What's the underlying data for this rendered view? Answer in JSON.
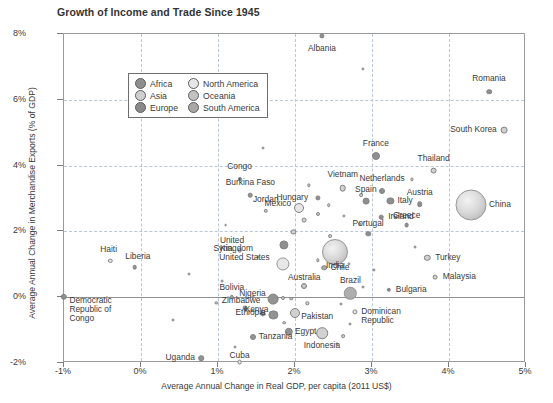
{
  "chart_data": {
    "type": "scatter",
    "title": "Growth of Income and Trade Since 1945",
    "xlabel": "Average Annual Change in Real GDP, per capita (2011 US$)",
    "ylabel": "Average Annual Change in Merchandise Exports (% of GDP)",
    "xlim": [
      -1,
      5
    ],
    "ylim": [
      -2,
      8
    ],
    "xticks": [
      "-1%",
      "0%",
      "1%",
      "2%",
      "3%",
      "4%",
      "5%"
    ],
    "xtick_values": [
      -1,
      0,
      1,
      2,
      3,
      4,
      5
    ],
    "yticks": [
      "8%",
      "6%",
      "4%",
      "2%",
      "0%",
      "-2%"
    ],
    "ytick_values": [
      8,
      6,
      4,
      2,
      0,
      -2
    ],
    "grid": true,
    "size_encodes": "population / economy size",
    "legend": {
      "position": "top-left inside plot",
      "title": "",
      "entries": [
        {
          "label": "Africa",
          "color": "#8e8e8e"
        },
        {
          "label": "North America",
          "color": "#e6e6e6"
        },
        {
          "label": "Asia",
          "color": "#cfcfcf"
        },
        {
          "label": "Oceania",
          "color": "#c2c2c2"
        },
        {
          "label": "Europe",
          "color": "#8a8a8a"
        },
        {
          "label": "South America",
          "color": "#a8a8a8"
        }
      ]
    },
    "points": [
      {
        "name": "Albania",
        "x": 2.35,
        "y": 7.95,
        "r": 2.6,
        "group": "Europe",
        "lx": 2.35,
        "ly": 7.55,
        "anchor": "c"
      },
      {
        "name": "Romania",
        "x": 4.52,
        "y": 6.25,
        "r": 2.8,
        "group": "Europe",
        "lx": 4.52,
        "ly": 6.62,
        "anchor": "c"
      },
      {
        "name": "South Korea",
        "x": 4.72,
        "y": 5.07,
        "r": 3.4,
        "group": "Asia",
        "lx": 4.62,
        "ly": 5.07,
        "anchor": "r"
      },
      {
        "name": "France",
        "x": 3.05,
        "y": 4.28,
        "r": 4.0,
        "group": "Europe",
        "lx": 3.05,
        "ly": 4.66,
        "anchor": "c"
      },
      {
        "name": "Thailand",
        "x": 3.8,
        "y": 3.85,
        "r": 3.4,
        "group": "Asia",
        "lx": 3.8,
        "ly": 4.2,
        "anchor": "c"
      },
      {
        "name": "Vietnam",
        "x": 2.62,
        "y": 3.32,
        "r": 3.3,
        "group": "Asia",
        "lx": 2.62,
        "ly": 3.72,
        "anchor": "c"
      },
      {
        "name": "Netherlands",
        "x": 3.13,
        "y": 3.22,
        "r": 3.0,
        "group": "Europe",
        "lx": 3.13,
        "ly": 3.58,
        "anchor": "c"
      },
      {
        "name": "Congo",
        "x": 1.28,
        "y": 3.6,
        "r": 2.1,
        "group": "Africa",
        "lx": 1.28,
        "ly": 3.96,
        "anchor": "c"
      },
      {
        "name": "Burkina Faso",
        "x": 1.42,
        "y": 3.1,
        "r": 2.3,
        "group": "Africa",
        "lx": 1.42,
        "ly": 3.46,
        "anchor": "c"
      },
      {
        "name": "Hungary",
        "x": 2.3,
        "y": 3.02,
        "r": 2.6,
        "group": "Europe",
        "lx": 2.17,
        "ly": 3.02,
        "anchor": "r"
      },
      {
        "name": "Spain",
        "x": 2.92,
        "y": 2.92,
        "r": 3.4,
        "group": "Europe",
        "lx": 2.92,
        "ly": 3.25,
        "anchor": "c"
      },
      {
        "name": "Italy",
        "x": 3.24,
        "y": 2.92,
        "r": 3.6,
        "group": "Europe",
        "lx": 3.33,
        "ly": 2.92,
        "anchor": "l"
      },
      {
        "name": "Austria",
        "x": 3.62,
        "y": 2.82,
        "r": 2.8,
        "group": "Europe",
        "lx": 3.62,
        "ly": 3.18,
        "anchor": "c"
      },
      {
        "name": "China",
        "x": 4.28,
        "y": 2.8,
        "r": 15.5,
        "group": "Asia",
        "lx": 4.52,
        "ly": 2.8,
        "anchor": "l"
      },
      {
        "name": "Mexico",
        "x": 2.05,
        "y": 2.7,
        "r": 5.0,
        "group": "North America",
        "lx": 1.95,
        "ly": 2.82,
        "anchor": "r"
      },
      {
        "name": "Jordan",
        "x": 1.62,
        "y": 2.62,
        "r": 2.2,
        "group": "Asia",
        "lx": 1.62,
        "ly": 2.96,
        "anchor": "c"
      },
      {
        "name": "Ireland",
        "x": 3.12,
        "y": 2.44,
        "r": 2.3,
        "group": "Europe",
        "lx": 3.21,
        "ly": 2.44,
        "anchor": "l"
      },
      {
        "name": "Greece",
        "x": 3.45,
        "y": 2.18,
        "r": 2.4,
        "group": "Europe",
        "lx": 3.45,
        "ly": 2.48,
        "anchor": "c"
      },
      {
        "name": "Portugal",
        "x": 2.95,
        "y": 1.92,
        "r": 2.7,
        "group": "Europe",
        "lx": 2.95,
        "ly": 2.24,
        "anchor": "c"
      },
      {
        "name": "United Kingdom",
        "x": 1.86,
        "y": 1.6,
        "r": 4.6,
        "group": "Europe",
        "lx": 1.7,
        "ly": 1.72,
        "anchor": "r"
      },
      {
        "name": "Syria",
        "x": 1.28,
        "y": 1.42,
        "r": 2.3,
        "group": "Asia",
        "lx": 1.19,
        "ly": 1.48,
        "anchor": "r"
      },
      {
        "name": "India",
        "x": 2.52,
        "y": 1.38,
        "r": 13.0,
        "group": "Asia",
        "lx": 2.52,
        "ly": 0.95,
        "anchor": "c"
      },
      {
        "name": "Turkey",
        "x": 3.72,
        "y": 1.2,
        "r": 3.2,
        "group": "Asia",
        "lx": 3.82,
        "ly": 1.2,
        "anchor": "l"
      },
      {
        "name": "United States",
        "x": 1.84,
        "y": 1.02,
        "r": 6.6,
        "group": "North America",
        "lx": 1.67,
        "ly": 1.18,
        "anchor": "r"
      },
      {
        "name": "Chile",
        "x": 2.38,
        "y": 0.9,
        "r": 2.8,
        "group": "South America",
        "lx": 2.46,
        "ly": 0.88,
        "anchor": "l"
      },
      {
        "name": "Malaysia",
        "x": 3.82,
        "y": 0.62,
        "r": 2.4,
        "group": "Asia",
        "lx": 3.92,
        "ly": 0.62,
        "anchor": "l"
      },
      {
        "name": "Australia",
        "x": 2.12,
        "y": 0.34,
        "r": 3.0,
        "group": "Oceania",
        "lx": 2.12,
        "ly": 0.58,
        "anchor": "c"
      },
      {
        "name": "Haiti",
        "x": -0.4,
        "y": 1.1,
        "r": 2.2,
        "group": "North America",
        "lx": -0.42,
        "ly": 1.42,
        "anchor": "c"
      },
      {
        "name": "Liberia",
        "x": -0.08,
        "y": 0.92,
        "r": 2.3,
        "group": "Africa",
        "lx": -0.04,
        "ly": 1.22,
        "anchor": "c"
      },
      {
        "name": "Brazil",
        "x": 2.72,
        "y": 0.12,
        "r": 6.2,
        "group": "South America",
        "lx": 2.72,
        "ly": 0.5,
        "anchor": "c"
      },
      {
        "name": "Bulgaria",
        "x": 3.22,
        "y": 0.22,
        "r": 2.2,
        "group": "Europe",
        "lx": 3.31,
        "ly": 0.22,
        "anchor": "l"
      },
      {
        "name": "Nigeria",
        "x": 1.72,
        "y": -0.06,
        "r": 5.4,
        "group": "Africa",
        "lx": 1.62,
        "ly": 0.1,
        "anchor": "r"
      },
      {
        "name": "Bolivia",
        "x": 1.18,
        "y": 0.02,
        "r": 2.2,
        "group": "South America",
        "lx": 1.18,
        "ly": 0.28,
        "anchor": "c"
      },
      {
        "name": "Democratic Republic of Congo",
        "x": -1.0,
        "y": 0.02,
        "r": 3.2,
        "group": "Africa",
        "lx": -0.93,
        "ly": -0.12,
        "anchor": "l"
      },
      {
        "name": "Zimbabwe",
        "x": 1.35,
        "y": -0.32,
        "r": 2.5,
        "group": "Africa",
        "lx": 1.3,
        "ly": -0.12,
        "anchor": "c"
      },
      {
        "name": "Kenya",
        "x": 1.58,
        "y": -0.52,
        "r": 2.6,
        "group": "Africa",
        "lx": 1.5,
        "ly": -0.4,
        "anchor": "c"
      },
      {
        "name": "Ethiopia",
        "x": 1.72,
        "y": -0.55,
        "r": 4.6,
        "group": "Africa",
        "lx": 1.62,
        "ly": -0.48,
        "anchor": "r"
      },
      {
        "name": "Pakistan",
        "x": 2.0,
        "y": -0.48,
        "r": 5.0,
        "group": "Asia",
        "lx": 2.08,
        "ly": -0.6,
        "anchor": "l"
      },
      {
        "name": "Dominican Republic",
        "x": 2.78,
        "y": -0.45,
        "r": 2.6,
        "group": "North America",
        "lx": 2.86,
        "ly": -0.45,
        "anchor": "l"
      },
      {
        "name": "Egypt",
        "x": 1.92,
        "y": -1.05,
        "r": 4.2,
        "group": "Africa",
        "lx": 2.0,
        "ly": -1.05,
        "anchor": "l"
      },
      {
        "name": "Indonesia",
        "x": 2.35,
        "y": -1.1,
        "r": 5.8,
        "group": "Asia",
        "lx": 2.35,
        "ly": -1.48,
        "anchor": "c"
      },
      {
        "name": "Tanzania",
        "x": 1.45,
        "y": -1.22,
        "r": 3.0,
        "group": "Africa",
        "lx": 1.53,
        "ly": -1.22,
        "anchor": "l"
      },
      {
        "name": "Uganda",
        "x": 0.78,
        "y": -1.85,
        "r": 2.8,
        "group": "Africa",
        "lx": 0.7,
        "ly": -1.85,
        "anchor": "r"
      },
      {
        "name": "Cuba",
        "x": 1.28,
        "y": -1.98,
        "r": 2.4,
        "group": "North America",
        "lx": 1.28,
        "ly": -1.78,
        "anchor": "c"
      }
    ],
    "unlabeled_points": [
      {
        "x": 2.88,
        "y": 6.95,
        "r": 1.6
      },
      {
        "x": 1.58,
        "y": 4.55,
        "r": 1.5
      },
      {
        "x": 3.52,
        "y": 3.58,
        "r": 1.6
      },
      {
        "x": 2.18,
        "y": 3.4,
        "r": 1.7
      },
      {
        "x": 2.86,
        "y": 3.1,
        "r": 1.9
      },
      {
        "x": 2.44,
        "y": 2.8,
        "r": 1.8
      },
      {
        "x": 2.3,
        "y": 2.52,
        "r": 2.0
      },
      {
        "x": 2.64,
        "y": 2.48,
        "r": 1.6
      },
      {
        "x": 2.12,
        "y": 2.34,
        "r": 2.4
      },
      {
        "x": 2.84,
        "y": 2.22,
        "r": 1.9
      },
      {
        "x": 1.98,
        "y": 1.98,
        "r": 2.6
      },
      {
        "x": 2.46,
        "y": 1.86,
        "r": 1.9
      },
      {
        "x": 2.46,
        "y": 1.6,
        "r": 1.7
      },
      {
        "x": 3.56,
        "y": 1.52,
        "r": 1.5
      },
      {
        "x": 1.52,
        "y": 1.22,
        "r": 1.5
      },
      {
        "x": 2.3,
        "y": 1.12,
        "r": 1.7
      },
      {
        "x": 2.7,
        "y": 1.0,
        "r": 1.6
      },
      {
        "x": 3.02,
        "y": 0.84,
        "r": 1.5
      },
      {
        "x": 0.62,
        "y": 0.7,
        "r": 1.5
      },
      {
        "x": 1.05,
        "y": 0.48,
        "r": 1.4
      },
      {
        "x": 2.88,
        "y": 0.3,
        "r": 1.5
      },
      {
        "x": 1.85,
        "y": -0.02,
        "r": 2.0
      },
      {
        "x": 1.95,
        "y": -0.04,
        "r": 1.8
      },
      {
        "x": 1.45,
        "y": 0.0,
        "r": 1.5
      },
      {
        "x": 2.16,
        "y": -0.18,
        "r": 1.7
      },
      {
        "x": 2.6,
        "y": -0.2,
        "r": 1.5
      },
      {
        "x": 0.98,
        "y": -0.18,
        "r": 1.6
      },
      {
        "x": 1.86,
        "y": -0.78,
        "r": 1.8
      },
      {
        "x": 2.72,
        "y": -0.82,
        "r": 1.5
      },
      {
        "x": 2.62,
        "y": -1.18,
        "r": 1.9
      },
      {
        "x": 1.22,
        "y": -1.52,
        "r": 1.5
      },
      {
        "x": 2.54,
        "y": -1.42,
        "r": 1.6
      },
      {
        "x": 1.1,
        "y": 2.18,
        "r": 1.4
      },
      {
        "x": 0.42,
        "y": -0.7,
        "r": 1.5
      }
    ]
  }
}
